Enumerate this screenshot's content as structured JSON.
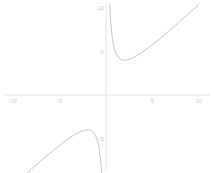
{
  "chart_data": {
    "type": "line",
    "title": "",
    "subtitle": "",
    "xlabel": "",
    "ylabel": "",
    "xlim": [
      -10,
      10
    ],
    "ylim": [
      -10,
      10
    ],
    "grid": false,
    "legend": null,
    "axis_style": "crossed-at-origin",
    "line_color": "#b9b5ae",
    "axis_color": "#d8d5d0",
    "label_color": "#c9c6c0",
    "background": "#ffffff",
    "function": "y = x + 4/x",
    "vertical_asymptote": 0,
    "oblique_asymptote": "y = x",
    "xticks": [
      -10,
      -5,
      5,
      10
    ],
    "xtick_labels": [
      "-10",
      "-5",
      "5",
      "10"
    ],
    "yticks": [
      -10,
      -5,
      5,
      10
    ],
    "ytick_labels": [
      "-10",
      "-5",
      "-5",
      "10"
    ],
    "annotations": [],
    "series": [
      {
        "name": "upper-branch",
        "minimum": [
          2,
          4
        ],
        "x": [
          0.4,
          0.45,
          0.5,
          0.55,
          0.6,
          0.7,
          0.8,
          0.9,
          1.0,
          1.1,
          1.2,
          1.3,
          1.4,
          1.5,
          1.6,
          1.8,
          2.0,
          2.2,
          2.4,
          2.6,
          2.8,
          3.0,
          3.4,
          3.8,
          4.2,
          4.6,
          5.0,
          5.6,
          6.2,
          6.8,
          7.4,
          8.0,
          8.6,
          9.2,
          9.8,
          10.0
        ],
        "y": [
          10.4,
          9.34,
          8.5,
          7.82,
          7.27,
          6.41,
          5.8,
          5.34,
          5.0,
          4.74,
          4.53,
          4.38,
          4.26,
          4.17,
          4.1,
          4.02,
          4.0,
          4.02,
          4.07,
          4.14,
          4.23,
          4.33,
          4.58,
          4.85,
          5.15,
          5.47,
          5.8,
          6.31,
          6.85,
          7.39,
          7.94,
          8.5,
          9.07,
          9.63,
          10.21,
          10.4
        ]
      },
      {
        "name": "lower-branch",
        "maximum": [
          -2,
          -4
        ],
        "x": [
          -10.0,
          -9.8,
          -9.2,
          -8.6,
          -8.0,
          -7.4,
          -6.8,
          -6.2,
          -5.6,
          -5.0,
          -4.6,
          -4.2,
          -3.8,
          -3.4,
          -3.0,
          -2.8,
          -2.6,
          -2.4,
          -2.2,
          -2.0,
          -1.8,
          -1.6,
          -1.5,
          -1.4,
          -1.3,
          -1.2,
          -1.1,
          -1.0,
          -0.9,
          -0.8,
          -0.7,
          -0.6,
          -0.55,
          -0.5,
          -0.45,
          -0.4
        ],
        "y": [
          -10.4,
          -10.21,
          -9.63,
          -9.07,
          -8.5,
          -7.94,
          -7.39,
          -6.85,
          -6.31,
          -5.8,
          -5.47,
          -5.15,
          -4.85,
          -4.58,
          -4.33,
          -4.23,
          -4.14,
          -4.07,
          -4.02,
          -4.0,
          -4.02,
          -4.1,
          -4.17,
          -4.26,
          -4.38,
          -4.53,
          -4.74,
          -5.0,
          -5.34,
          -5.8,
          -6.41,
          -7.27,
          -7.82,
          -8.5,
          -9.34,
          -10.4
        ]
      }
    ]
  },
  "geometry": {
    "origin_x_px": 106,
    "origin_y_px": 95,
    "px_per_unit_x": 9.3,
    "px_per_unit_y": 8.7
  }
}
